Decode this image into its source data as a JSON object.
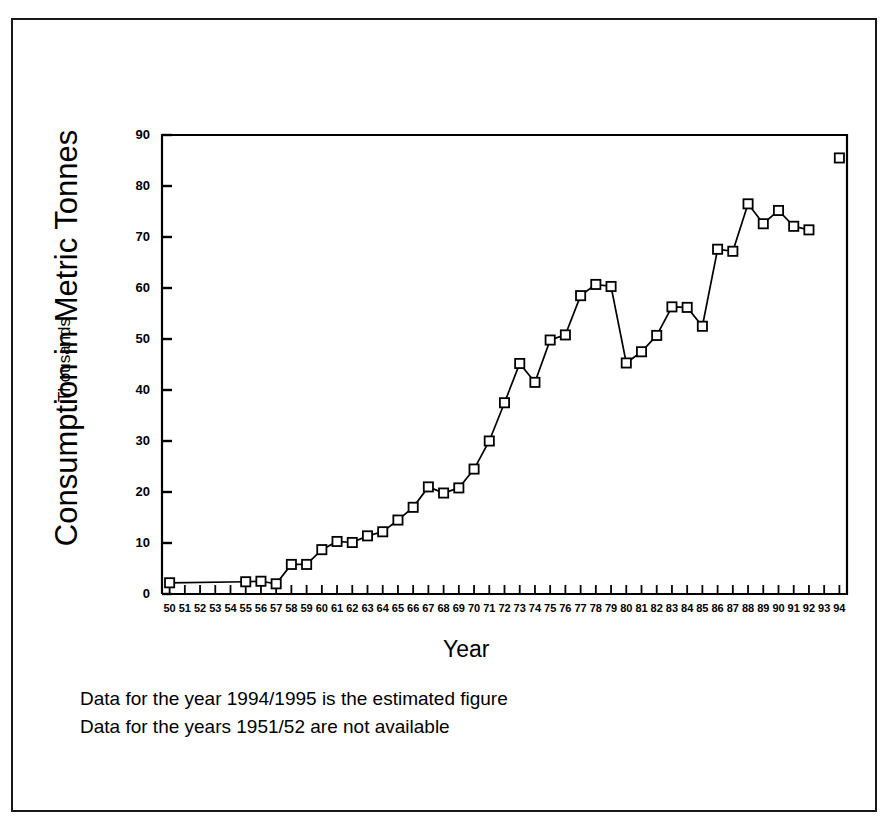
{
  "figure": {
    "y_axis_title": "Consumption in Metric Tonnes",
    "y_axis_subtitle": "Thousands",
    "x_axis_title": "Year",
    "notes": [
      "Data for the year 1994/1995 is the estimated figure",
      "Data for the years 1951/52 are not available"
    ],
    "line_color": "#000000",
    "marker_color": "#000000",
    "background_color": "#ffffff",
    "frame_color": "#1a1a1a"
  },
  "chart_data": {
    "type": "line",
    "title": "",
    "xlabel": "Year",
    "ylabel": "Consumption in Metric Tonnes (Thousands)",
    "xlim": [
      49.5,
      94.5
    ],
    "ylim": [
      0,
      90
    ],
    "ytick_labels": [
      "0",
      "10",
      "20",
      "30",
      "40",
      "50",
      "60",
      "70",
      "80",
      "90"
    ],
    "yticks": [
      0,
      10,
      20,
      30,
      40,
      50,
      60,
      70,
      80,
      90
    ],
    "xtick_labels": [
      "50",
      "51",
      "52",
      "53",
      "54",
      "55",
      "56",
      "57",
      "58",
      "59",
      "60",
      "61",
      "62",
      "63",
      "64",
      "65",
      "66",
      "67",
      "68",
      "69",
      "70",
      "71",
      "72",
      "73",
      "74",
      "75",
      "76",
      "77",
      "78",
      "79",
      "80",
      "81",
      "82",
      "83",
      "84",
      "85",
      "86",
      "87",
      "88",
      "89",
      "90",
      "91",
      "92",
      "93",
      "94"
    ],
    "xticks": [
      50,
      51,
      52,
      53,
      54,
      55,
      56,
      57,
      58,
      59,
      60,
      61,
      62,
      63,
      64,
      65,
      66,
      67,
      68,
      69,
      70,
      71,
      72,
      73,
      74,
      75,
      76,
      77,
      78,
      79,
      80,
      81,
      82,
      83,
      84,
      85,
      86,
      87,
      88,
      89,
      90,
      91,
      92,
      93,
      94
    ],
    "grid": false,
    "legend": "none",
    "marker": "square-open",
    "series": [
      {
        "name": "Consumption",
        "points": [
          {
            "x": 50,
            "y": 2.2
          },
          {
            "x": 55,
            "y": 2.4
          },
          {
            "x": 56,
            "y": 2.5
          },
          {
            "x": 57,
            "y": 2.0
          },
          {
            "x": 58,
            "y": 5.8
          },
          {
            "x": 59,
            "y": 5.8
          },
          {
            "x": 60,
            "y": 8.7
          },
          {
            "x": 61,
            "y": 10.3
          },
          {
            "x": 62,
            "y": 10.1
          },
          {
            "x": 63,
            "y": 11.4
          },
          {
            "x": 64,
            "y": 12.2
          },
          {
            "x": 65,
            "y": 14.5
          },
          {
            "x": 66,
            "y": 17.0
          },
          {
            "x": 67,
            "y": 21.0
          },
          {
            "x": 68,
            "y": 19.8
          },
          {
            "x": 69,
            "y": 20.8
          },
          {
            "x": 70,
            "y": 24.5
          },
          {
            "x": 71,
            "y": 30.0
          },
          {
            "x": 72,
            "y": 37.5
          },
          {
            "x": 73,
            "y": 45.2
          },
          {
            "x": 74,
            "y": 41.5
          },
          {
            "x": 75,
            "y": 49.8
          },
          {
            "x": 76,
            "y": 50.8
          },
          {
            "x": 77,
            "y": 58.5
          },
          {
            "x": 78,
            "y": 60.7
          },
          {
            "x": 79,
            "y": 60.3
          },
          {
            "x": 80,
            "y": 45.3
          },
          {
            "x": 81,
            "y": 47.5
          },
          {
            "x": 82,
            "y": 50.7
          },
          {
            "x": 83,
            "y": 56.3
          },
          {
            "x": 84,
            "y": 56.2
          },
          {
            "x": 85,
            "y": 52.5
          },
          {
            "x": 86,
            "y": 67.6
          },
          {
            "x": 87,
            "y": 67.2
          },
          {
            "x": 88,
            "y": 76.5
          },
          {
            "x": 89,
            "y": 72.6
          },
          {
            "x": 90,
            "y": 75.2
          },
          {
            "x": 91,
            "y": 72.1
          },
          {
            "x": 92,
            "y": 71.4
          }
        ]
      },
      {
        "name": "Estimated 1994/1995",
        "points": [
          {
            "x": 94,
            "y": 85.5
          }
        ]
      }
    ]
  }
}
